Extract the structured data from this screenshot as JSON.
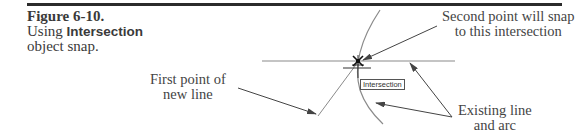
{
  "figure": {
    "number": "Figure 6-10.",
    "caption_prefix": "Using ",
    "caption_bold": "Intersection",
    "caption_suffix": "object snap."
  },
  "callouts": {
    "second_point": {
      "line1": "Second point will snap",
      "line2": "to this intersection"
    },
    "first_point": {
      "line1": "First point of",
      "line2": "new line"
    },
    "existing": {
      "line1": "Existing line",
      "line2": "and arc"
    }
  },
  "snap_tooltip": "Intersection",
  "colors": {
    "rule": "#2b2b2b",
    "text": "#3a3a3a",
    "geometry": "#8a8a8a",
    "leader": "#444444"
  }
}
